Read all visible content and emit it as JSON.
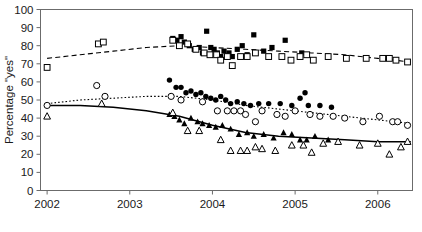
{
  "chart_data": {
    "type": "scatter",
    "title": "",
    "xlabel": "",
    "ylabel": "Percentage \"yes\"",
    "xlim": [
      2001.92,
      2006.42
    ],
    "ylim": [
      0,
      100
    ],
    "xticks": [
      2002,
      2003,
      2004,
      2005,
      2006
    ],
    "xtick_labels": [
      "2002",
      "2003",
      "2004",
      "2005",
      "2006"
    ],
    "yticks": [
      0,
      10,
      20,
      30,
      40,
      50,
      60,
      70,
      80,
      90,
      100
    ],
    "ytick_labels": [
      "0",
      "10",
      "20",
      "30",
      "40",
      "50",
      "60",
      "70",
      "80",
      "90",
      "100"
    ],
    "grid": false,
    "legend": "none",
    "axis_color": "#6b6b6b",
    "marker_color": "#000000",
    "series": [
      {
        "name": "top-filled-squares",
        "marker": "filled-square",
        "points": [
          [
            2003.52,
            84
          ],
          [
            2003.57,
            83
          ],
          [
            2003.62,
            85
          ],
          [
            2003.66,
            82
          ],
          [
            2003.72,
            80
          ],
          [
            2003.78,
            78
          ],
          [
            2003.84,
            79
          ],
          [
            2003.88,
            76
          ],
          [
            2003.93,
            88
          ],
          [
            2003.98,
            79
          ],
          [
            2004.02,
            78
          ],
          [
            2004.06,
            76
          ],
          [
            2004.1,
            74
          ],
          [
            2004.14,
            77
          ],
          [
            2004.2,
            76
          ],
          [
            2004.24,
            74
          ],
          [
            2004.3,
            78
          ],
          [
            2004.36,
            80
          ],
          [
            2004.42,
            75
          ],
          [
            2004.5,
            86
          ],
          [
            2004.62,
            77
          ],
          [
            2004.72,
            79
          ],
          [
            2004.88,
            83
          ],
          [
            2005.08,
            76
          ]
        ]
      },
      {
        "name": "top-open-squares",
        "marker": "open-square",
        "points": [
          [
            2002.0,
            68
          ],
          [
            2002.62,
            81
          ],
          [
            2002.68,
            82
          ],
          [
            2003.52,
            83
          ],
          [
            2003.6,
            80
          ],
          [
            2003.7,
            81
          ],
          [
            2003.8,
            78
          ],
          [
            2003.9,
            76
          ],
          [
            2003.97,
            75
          ],
          [
            2004.05,
            75
          ],
          [
            2004.1,
            72
          ],
          [
            2004.18,
            74
          ],
          [
            2004.24,
            69
          ],
          [
            2004.34,
            74
          ],
          [
            2004.42,
            74
          ],
          [
            2004.52,
            76
          ],
          [
            2004.68,
            74
          ],
          [
            2004.84,
            74
          ],
          [
            2004.95,
            72
          ],
          [
            2005.06,
            74
          ],
          [
            2005.14,
            75
          ],
          [
            2005.22,
            72
          ],
          [
            2005.4,
            74
          ],
          [
            2005.62,
            73
          ],
          [
            2005.86,
            73
          ],
          [
            2006.06,
            73
          ],
          [
            2006.14,
            73
          ],
          [
            2006.22,
            72
          ],
          [
            2006.36,
            71
          ]
        ]
      },
      {
        "name": "mid-filled-circles",
        "marker": "filled-circle",
        "points": [
          [
            2003.48,
            61
          ],
          [
            2003.56,
            57
          ],
          [
            2003.62,
            57
          ],
          [
            2003.68,
            54
          ],
          [
            2003.74,
            55
          ],
          [
            2003.8,
            53
          ],
          [
            2003.86,
            54
          ],
          [
            2003.92,
            52
          ],
          [
            2003.98,
            51
          ],
          [
            2004.04,
            50
          ],
          [
            2004.1,
            52
          ],
          [
            2004.16,
            50
          ],
          [
            2004.22,
            48
          ],
          [
            2004.3,
            49
          ],
          [
            2004.38,
            48
          ],
          [
            2004.46,
            47
          ],
          [
            2004.56,
            48
          ],
          [
            2004.68,
            48
          ],
          [
            2004.82,
            48
          ],
          [
            2004.96,
            47
          ],
          [
            2005.06,
            51
          ],
          [
            2005.16,
            47
          ],
          [
            2005.3,
            47
          ],
          [
            2005.44,
            46
          ],
          [
            2005.12,
            54
          ]
        ]
      },
      {
        "name": "mid-open-circles",
        "marker": "open-circle",
        "points": [
          [
            2002.0,
            47
          ],
          [
            2002.6,
            58
          ],
          [
            2002.7,
            52
          ],
          [
            2003.5,
            52
          ],
          [
            2003.62,
            50
          ],
          [
            2003.88,
            49
          ],
          [
            2004.06,
            44
          ],
          [
            2004.18,
            44
          ],
          [
            2004.26,
            44
          ],
          [
            2004.34,
            44
          ],
          [
            2004.4,
            42
          ],
          [
            2004.6,
            44
          ],
          [
            2004.78,
            42
          ],
          [
            2004.88,
            41
          ],
          [
            2005.0,
            44
          ],
          [
            2005.18,
            42
          ],
          [
            2005.3,
            41
          ],
          [
            2005.46,
            41
          ],
          [
            2005.6,
            40
          ],
          [
            2005.82,
            38
          ],
          [
            2006.02,
            41
          ],
          [
            2006.18,
            38
          ],
          [
            2006.24,
            38
          ],
          [
            2006.36,
            36
          ],
          [
            2004.52,
            38
          ]
        ]
      },
      {
        "name": "low-filled-triangles",
        "marker": "filled-triangle",
        "points": [
          [
            2003.48,
            42
          ],
          [
            2003.54,
            41
          ],
          [
            2003.6,
            39
          ],
          [
            2003.66,
            37
          ],
          [
            2003.74,
            40
          ],
          [
            2003.82,
            38
          ],
          [
            2003.88,
            37
          ],
          [
            2003.96,
            36
          ],
          [
            2004.04,
            35
          ],
          [
            2004.12,
            36
          ],
          [
            2004.22,
            34
          ],
          [
            2004.32,
            31
          ],
          [
            2004.42,
            32
          ],
          [
            2004.5,
            30
          ],
          [
            2004.62,
            31
          ],
          [
            2004.74,
            29
          ],
          [
            2004.86,
            32
          ],
          [
            2004.96,
            31
          ],
          [
            2005.06,
            28
          ],
          [
            2005.14,
            28
          ],
          [
            2005.24,
            30
          ],
          [
            2005.4,
            28
          ]
        ]
      },
      {
        "name": "low-open-triangles",
        "marker": "open-triangle",
        "points": [
          [
            2002.0,
            41
          ],
          [
            2002.66,
            48
          ],
          [
            2003.52,
            43
          ],
          [
            2003.7,
            33
          ],
          [
            2003.84,
            33
          ],
          [
            2004.1,
            28
          ],
          [
            2004.22,
            22
          ],
          [
            2004.34,
            22
          ],
          [
            2004.42,
            22
          ],
          [
            2004.52,
            24
          ],
          [
            2004.6,
            23
          ],
          [
            2004.76,
            22
          ],
          [
            2004.96,
            25
          ],
          [
            2005.1,
            25
          ],
          [
            2005.2,
            21
          ],
          [
            2005.34,
            26
          ],
          [
            2005.52,
            27
          ],
          [
            2005.78,
            25
          ],
          [
            2006.0,
            26
          ],
          [
            2006.14,
            20
          ],
          [
            2006.28,
            24
          ],
          [
            2006.36,
            27
          ]
        ]
      }
    ],
    "trends": [
      {
        "name": "top-trend",
        "style": "dashed",
        "points": [
          [
            2002.0,
            73
          ],
          [
            2002.4,
            75
          ],
          [
            2002.8,
            77
          ],
          [
            2003.2,
            79
          ],
          [
            2003.6,
            80
          ],
          [
            2004.0,
            79
          ],
          [
            2004.4,
            78
          ],
          [
            2004.8,
            77
          ],
          [
            2005.2,
            76
          ],
          [
            2005.6,
            75
          ],
          [
            2006.0,
            73
          ],
          [
            2006.4,
            71
          ]
        ]
      },
      {
        "name": "mid-trend",
        "style": "dotted",
        "points": [
          [
            2002.0,
            48
          ],
          [
            2002.4,
            50
          ],
          [
            2002.8,
            51
          ],
          [
            2003.2,
            52
          ],
          [
            2003.6,
            52
          ],
          [
            2004.0,
            50
          ],
          [
            2004.4,
            47
          ],
          [
            2004.8,
            45
          ],
          [
            2005.2,
            43
          ],
          [
            2005.6,
            41
          ],
          [
            2006.0,
            39
          ],
          [
            2006.4,
            37
          ]
        ]
      },
      {
        "name": "low-trend",
        "style": "solid",
        "points": [
          [
            2002.0,
            47
          ],
          [
            2002.4,
            47
          ],
          [
            2002.8,
            46
          ],
          [
            2003.2,
            44
          ],
          [
            2003.6,
            41
          ],
          [
            2004.0,
            36
          ],
          [
            2004.4,
            32
          ],
          [
            2004.8,
            30
          ],
          [
            2005.2,
            29
          ],
          [
            2005.6,
            28
          ],
          [
            2006.0,
            27
          ],
          [
            2006.4,
            27
          ]
        ]
      }
    ]
  }
}
